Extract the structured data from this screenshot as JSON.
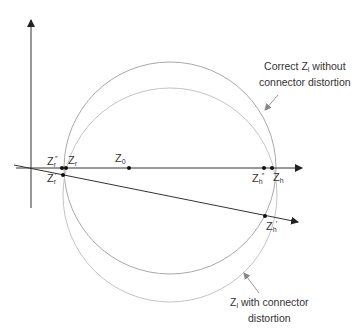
{
  "diagram": {
    "type": "smith-style impedance circle comparison",
    "colors": {
      "axis": "#333333",
      "circle_correct": "#a8a8a8",
      "circle_distorted": "#bcbcbc",
      "point": "#111111",
      "text": "#333333"
    },
    "points": {
      "z0": {
        "base": "Z",
        "sub": "0",
        "sup": ""
      },
      "zr": {
        "base": "Z",
        "sub": "r",
        "sup": ""
      },
      "zr_double": {
        "base": "Z",
        "sub": "r",
        "sup": "″"
      },
      "zr_prime": {
        "base": "Z",
        "sub": "r",
        "sup": "′"
      },
      "zh": {
        "base": "Z",
        "sub": "h",
        "sup": ""
      },
      "zh_double": {
        "base": "Z",
        "sub": "h",
        "sup": "″"
      },
      "zh_prime": {
        "base": "Z",
        "sub": "h",
        "sup": "′"
      }
    },
    "annotations": {
      "correct": {
        "line1_pre": "Correct Z",
        "line1_sub": "l",
        "line1_post": " without",
        "line2": "connector distortion"
      },
      "distorted": {
        "line1_pre": "Z",
        "line1_sub": "l",
        "line1_post": " with connector",
        "line2": "distortion"
      }
    }
  }
}
